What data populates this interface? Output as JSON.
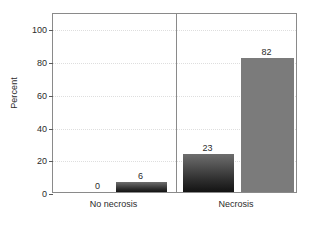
{
  "chart_data": {
    "type": "bar",
    "title": "",
    "xlabel": "",
    "ylabel": "Percent",
    "ylim": [
      0,
      110
    ],
    "yticks": [
      0,
      20,
      40,
      60,
      80,
      100
    ],
    "ytick_labels": [
      "0",
      "20",
      "40",
      "60",
      "80",
      "100"
    ],
    "grid": true,
    "legend": "none",
    "categories": [
      "No necrosis",
      "Necrosis"
    ],
    "series": [
      {
        "name": "dark",
        "values": [
          0,
          23
        ],
        "color": "#2e2e2e"
      },
      {
        "name": "light",
        "values": [
          6,
          82
        ],
        "color": "#7b7b7b"
      }
    ],
    "bars": [
      {
        "group": "No necrosis",
        "series": "dark",
        "value": 0,
        "label": "0",
        "color": "#2e2e2e"
      },
      {
        "group": "No necrosis",
        "series": "light",
        "value": 6,
        "label": "6",
        "color": "#4a4a4a"
      },
      {
        "group": "Necrosis",
        "series": "dark",
        "value": 23,
        "label": "23",
        "color": "#2e2e2e"
      },
      {
        "group": "Necrosis",
        "series": "light",
        "value": 82,
        "label": "82",
        "color": "#7b7b7b"
      }
    ],
    "group_divider": true,
    "axis_color": "#8a8a8a",
    "grid_color": "#dedede",
    "text_color": "#2b2b2b",
    "background": "#ffffff"
  }
}
